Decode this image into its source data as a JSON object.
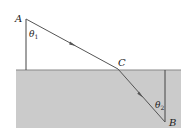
{
  "diagram": {
    "type": "refraction",
    "labels": {
      "point_a": "A",
      "point_b": "B",
      "point_c": "C",
      "angle_1": "θ",
      "angle_1_sub": "1",
      "angle_2": "θ",
      "angle_2_sub": "2"
    },
    "colors": {
      "medium": "#cbcbcb",
      "surface": "#888888",
      "ray": "#555555",
      "normal": "#444444"
    }
  }
}
